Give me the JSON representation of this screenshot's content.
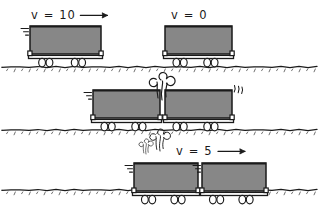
{
  "figure": {
    "background_color": "#ffffff",
    "ink_color": "#1a1a1a",
    "cart_fill_color": "#878787",
    "width": 327,
    "height": 213
  },
  "panels": [
    {
      "id": "before",
      "name": "before-collision",
      "ground_y": 67,
      "labels": [
        {
          "id": "v-left",
          "text": "v = 10",
          "x": 31,
          "y": 19,
          "arrow": true,
          "arrow_direction": "right"
        },
        {
          "id": "v-right",
          "text": "v = 0",
          "x": 171,
          "y": 19,
          "arrow": false,
          "arrow_direction": "none"
        }
      ],
      "carts": [
        {
          "id": "cart-a",
          "x": 30,
          "width": 71,
          "top_y": 26,
          "body_height": 28,
          "motion_lines": true,
          "jiggle": false
        },
        {
          "id": "cart-b",
          "x": 165,
          "width": 67,
          "top_y": 26,
          "body_height": 28,
          "motion_lines": false,
          "jiggle": false
        }
      ],
      "puffs": []
    },
    {
      "id": "impact",
      "name": "moment-of-collision",
      "ground_y": 130,
      "labels": [],
      "carts": [
        {
          "id": "cart-a",
          "x": 93,
          "width": 67,
          "top_y": 90,
          "body_height": 28,
          "motion_lines": true,
          "jiggle": false
        },
        {
          "id": "cart-b",
          "x": 165,
          "width": 67,
          "top_y": 90,
          "body_height": 28,
          "motion_lines": false,
          "jiggle": true
        }
      ],
      "puffs": [
        {
          "id": "puff-above",
          "x": 162,
          "y": 80,
          "scale": 1.0
        },
        {
          "id": "puff-below",
          "x": 160,
          "y": 135,
          "scale": 0.8
        }
      ]
    },
    {
      "id": "after",
      "name": "after-collision",
      "ground_y": 190,
      "labels": [
        {
          "id": "v-joined",
          "text": "v = 5",
          "x": 176,
          "y": 155,
          "arrow": true,
          "arrow_direction": "right"
        }
      ],
      "carts": [
        {
          "id": "cart-a",
          "x": 134,
          "width": 64,
          "top_y": 163,
          "body_height": 28,
          "motion_lines": true,
          "jiggle": false
        },
        {
          "id": "cart-b",
          "x": 202,
          "width": 64,
          "top_y": 163,
          "body_height": 28,
          "motion_lines": true,
          "jiggle": false
        }
      ],
      "puffs": [
        {
          "id": "puff-residual",
          "x": 146,
          "y": 143,
          "scale": 0.55
        }
      ]
    }
  ],
  "physics": {
    "v_initial_left": "10",
    "v_initial_right": "0",
    "v_final_combined": "5"
  }
}
